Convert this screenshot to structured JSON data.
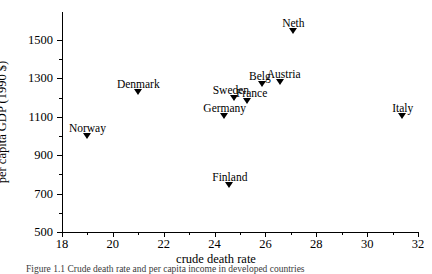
{
  "chart_data": {
    "type": "scatter",
    "title": "",
    "xlabel": "crude death rate",
    "ylabel": "per capita GDP (1990 $)",
    "xlim": [
      18,
      32
    ],
    "ylim": [
      500,
      1500
    ],
    "xticks": [
      18,
      20,
      22,
      24,
      26,
      28,
      30,
      32
    ],
    "xticks_minor": [
      19,
      21,
      23,
      25,
      27,
      29,
      31
    ],
    "yticks": [
      500,
      700,
      900,
      1100,
      1300,
      1500
    ],
    "yticks_minor": [
      600,
      800,
      1000,
      1200,
      1400
    ],
    "grid": false,
    "legend": "none",
    "marker": "triangle-down",
    "points": [
      {
        "label": "Norway",
        "x": 19.0,
        "y": 1000,
        "label_dx": 0,
        "label_dy": -13
      },
      {
        "label": "Denmark",
        "x": 21.0,
        "y": 1230,
        "label_dx": 0,
        "label_dy": -13
      },
      {
        "label": "Germany",
        "x": 24.4,
        "y": 1105,
        "label_dx": 0,
        "label_dy": -13
      },
      {
        "label": "Finland",
        "x": 24.6,
        "y": 745,
        "label_dx": 0,
        "label_dy": -13
      },
      {
        "label": "Sweden",
        "x": 24.8,
        "y": 1200,
        "label_dx": -4,
        "label_dy": -13
      },
      {
        "label": "France",
        "x": 25.3,
        "y": 1180,
        "label_dx": 4,
        "label_dy": -13
      },
      {
        "label": "Belg",
        "x": 25.9,
        "y": 1270,
        "label_dx": -3,
        "label_dy": -13
      },
      {
        "label": "Austria",
        "x": 26.6,
        "y": 1280,
        "label_dx": 3,
        "label_dy": -13
      },
      {
        "label": "Neth",
        "x": 27.1,
        "y": 1545,
        "label_dx": 0,
        "label_dy": -13
      },
      {
        "label": "Italy",
        "x": 31.4,
        "y": 1105,
        "label_dx": 0,
        "label_dy": -13
      }
    ]
  },
  "caption": "Figure 1.1  Crude death rate and per capita income in developed countries"
}
